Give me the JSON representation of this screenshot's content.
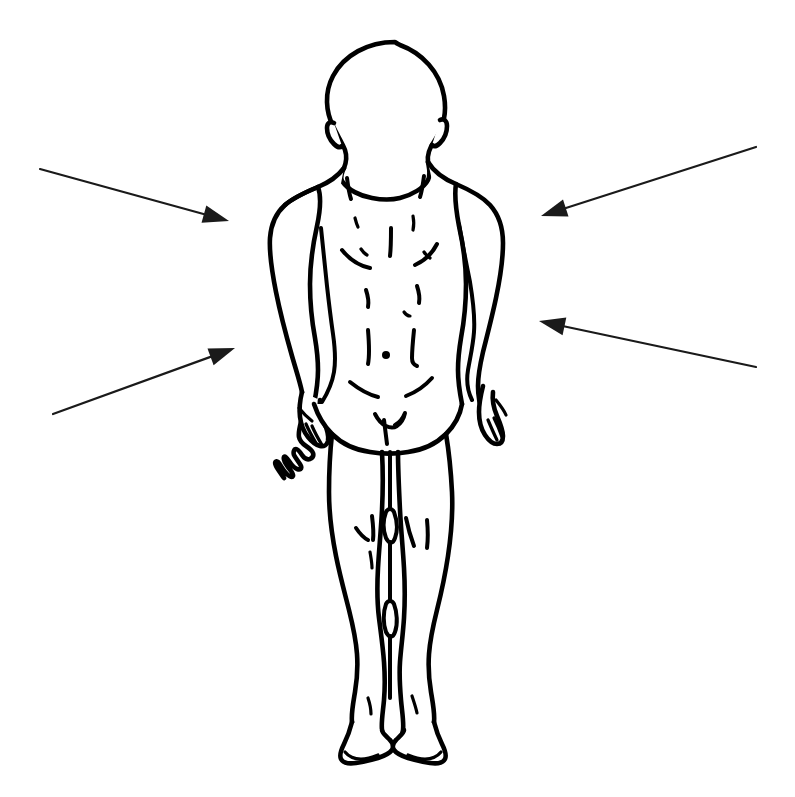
{
  "figure": {
    "title": "Anterior view of standing human male figure",
    "background_color": "#ffffff",
    "line_color": "#000000",
    "arrow_color": "#1a1a1a",
    "canvas": {
      "width": 795,
      "height": 797
    },
    "style": "black-and-white line drawing",
    "view": "anterior",
    "pose": "standing, arms at sides, palms facing thighs",
    "body_parts": [
      {
        "name": "head",
        "label": "head"
      },
      {
        "name": "ear-left",
        "label": "left ear"
      },
      {
        "name": "ear-right",
        "label": "right ear"
      },
      {
        "name": "neck",
        "label": "neck"
      },
      {
        "name": "shoulder-left",
        "label": "left shoulder"
      },
      {
        "name": "shoulder-right",
        "label": "right shoulder"
      },
      {
        "name": "chest",
        "label": "chest"
      },
      {
        "name": "abdomen",
        "label": "abdomen"
      },
      {
        "name": "navel",
        "label": "navel"
      },
      {
        "name": "arm-left",
        "label": "left arm"
      },
      {
        "name": "arm-right",
        "label": "right arm"
      },
      {
        "name": "hand-left",
        "label": "left hand"
      },
      {
        "name": "hand-right",
        "label": "right hand"
      },
      {
        "name": "pelvis",
        "label": "pelvis"
      },
      {
        "name": "thigh-left",
        "label": "left thigh"
      },
      {
        "name": "thigh-right",
        "label": "right thigh"
      },
      {
        "name": "knee-left",
        "label": "left knee"
      },
      {
        "name": "knee-right",
        "label": "right knee"
      },
      {
        "name": "shin-left",
        "label": "left shin"
      },
      {
        "name": "shin-right",
        "label": "right shin"
      },
      {
        "name": "foot-left",
        "label": "left foot"
      },
      {
        "name": "foot-right",
        "label": "right foot"
      }
    ]
  },
  "annotations": {
    "count": 4,
    "arrows": [
      {
        "id": "arrow-upper-left",
        "label": "",
        "side": "left",
        "direction": "points right",
        "tail": {
          "x": 40,
          "y": 169
        },
        "tip": {
          "x": 229,
          "y": 221
        },
        "targets": "left shoulder / upper arm"
      },
      {
        "id": "arrow-lower-left",
        "label": "",
        "side": "left",
        "direction": "points up-right",
        "tail": {
          "x": 53,
          "y": 414
        },
        "tip": {
          "x": 235,
          "y": 348
        },
        "targets": "left forearm / hip"
      },
      {
        "id": "arrow-upper-right",
        "label": "",
        "side": "right",
        "direction": "points down-left",
        "tail": {
          "x": 756,
          "y": 147
        },
        "tip": {
          "x": 541,
          "y": 216
        },
        "targets": "right shoulder / upper arm"
      },
      {
        "id": "arrow-lower-right",
        "label": "",
        "side": "right",
        "direction": "points up-left",
        "tail": {
          "x": 756,
          "y": 367
        },
        "tip": {
          "x": 539,
          "y": 321
        },
        "targets": "right forearm / hip"
      }
    ]
  }
}
